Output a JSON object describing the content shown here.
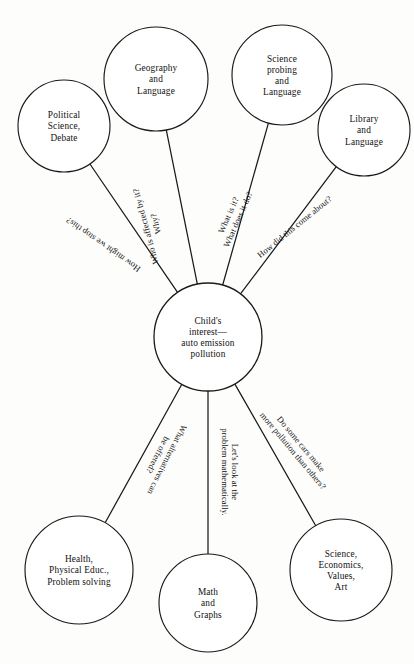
{
  "diagram": {
    "type": "radial-web-diagram",
    "background_color": "#fdfdfc",
    "line_color": "#1a1a1a",
    "text_color": "#111111",
    "center": {
      "id": "center",
      "lines": [
        "Child's",
        "interest—",
        "auto emission",
        "pollution"
      ],
      "cx": 208,
      "cy": 337,
      "r": 54
    },
    "nodes": [
      {
        "id": "political-science-debate",
        "lines": [
          "Political",
          "Science,",
          "Debate"
        ],
        "cx": 64,
        "cy": 126,
        "r": 46
      },
      {
        "id": "geography-and-language",
        "lines": [
          "Geography",
          "and",
          "Language"
        ],
        "cx": 156,
        "cy": 79,
        "r": 52
      },
      {
        "id": "science-probing-and-language",
        "lines": [
          "Science",
          "probing",
          "and",
          "Language"
        ],
        "cx": 282,
        "cy": 75,
        "r": 50
      },
      {
        "id": "library-and-language",
        "lines": [
          "Library",
          "and",
          "Language"
        ],
        "cx": 364,
        "cy": 130,
        "r": 46
      },
      {
        "id": "health-physical-educ-problem-solving",
        "lines": [
          "Health,",
          "Physical Educ.,",
          "Problem solving"
        ],
        "cx": 79,
        "cy": 570,
        "r": 54
      },
      {
        "id": "math-and-graphs",
        "lines": [
          "Math",
          "and",
          "Graphs"
        ],
        "cx": 208,
        "cy": 603,
        "r": 49
      },
      {
        "id": "science-economics-values-art",
        "lines": [
          "Science,",
          "Economics,",
          "Values,",
          "Art"
        ],
        "cx": 341,
        "cy": 570,
        "r": 51
      }
    ],
    "edges": [
      {
        "id": "edge-how-might-we-stop-this",
        "from": "center",
        "to": "political-science-debate",
        "lines": [
          "How might we stop this?"
        ],
        "label_rotation_deg": 215,
        "label_x": 110,
        "label_y": 235,
        "label_offset": 9
      },
      {
        "id": "edge-who-is-affected-by-it-why",
        "from": "center",
        "to": "geography-and-language",
        "lines": [
          "Who is affected by it?",
          "Why?"
        ],
        "label_rotation_deg": 255,
        "label_x": 162,
        "label_y": 222,
        "label_offset": 9
      },
      {
        "id": "edge-what-is-it-what-does-it-do",
        "from": "center",
        "to": "science-probing-and-language",
        "lines": [
          "What is it?",
          "What does it do?"
        ],
        "label_rotation_deg": -66,
        "label_x": 244,
        "label_y": 222,
        "label_offset": 9
      },
      {
        "id": "edge-how-did-this-come-about",
        "from": "center",
        "to": "library-and-language",
        "lines": [
          "How did this come about?"
        ],
        "label_rotation_deg": -39,
        "label_x": 302,
        "label_y": 236,
        "label_offset": 9
      },
      {
        "id": "edge-what-alternatives-can-be-offered",
        "from": "center",
        "to": "health-physical-educ-problem-solving",
        "lines": [
          "What alternatives can",
          "be offered?"
        ],
        "label_rotation_deg": 117,
        "label_x": 152,
        "label_y": 452,
        "label_offset": 9
      },
      {
        "id": "edge-lets-look-at-the-problem-mathematically",
        "from": "center",
        "to": "math-and-graphs",
        "lines": [
          "Let's look at the",
          "problem mathematically."
        ],
        "label_rotation_deg": 90,
        "label_x": 218,
        "label_y": 472,
        "label_offset": 9
      },
      {
        "id": "edge-do-some-cars-make-more-pollution",
        "from": "center",
        "to": "science-economics-values-art",
        "lines": [
          "Do some cars make",
          "more pollution than others?"
        ],
        "label_rotation_deg": 50,
        "label_x": 288,
        "label_y": 455,
        "label_offset": 9
      }
    ]
  }
}
